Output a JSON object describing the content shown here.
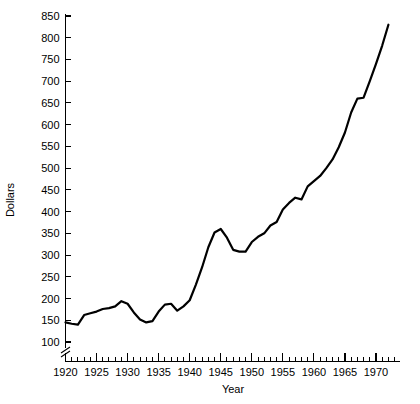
{
  "chart_data": {
    "type": "line",
    "title": "",
    "subtitle": "",
    "xlabel": "Year",
    "ylabel": "Dollars",
    "grid": false,
    "legend": "none",
    "xlim": [
      1920,
      1973
    ],
    "ylim": [
      90,
      850
    ],
    "y_axis_break": true,
    "y_axis_break_note": "axis broken below 100",
    "x_ticks_major": [
      1920,
      1925,
      1930,
      1935,
      1940,
      1945,
      1950,
      1955,
      1960,
      1965,
      1970
    ],
    "x_tick_labels": [
      "1920",
      "1925",
      "1930",
      "1935",
      "1940",
      "1945",
      "1950",
      "1955",
      "1960",
      "1965",
      "1970"
    ],
    "x_minor_tick_step": 1,
    "y_ticks": [
      100,
      150,
      200,
      250,
      300,
      350,
      400,
      450,
      500,
      550,
      600,
      650,
      700,
      750,
      800,
      850
    ],
    "y_tick_labels": [
      "100",
      "150",
      "200",
      "250",
      "300",
      "350",
      "400",
      "450",
      "500",
      "550",
      "600",
      "650",
      "700",
      "750",
      "800",
      "850"
    ],
    "series": [
      {
        "name": "Dollars",
        "color": "#000000",
        "x": [
          1920,
          1921,
          1922,
          1923,
          1924,
          1925,
          1926,
          1927,
          1928,
          1929,
          1930,
          1931,
          1932,
          1933,
          1934,
          1935,
          1936,
          1937,
          1938,
          1939,
          1940,
          1941,
          1942,
          1943,
          1944,
          1945,
          1946,
          1947,
          1948,
          1949,
          1950,
          1951,
          1952,
          1953,
          1954,
          1955,
          1956,
          1957,
          1958,
          1959,
          1960,
          1961,
          1962,
          1963,
          1964,
          1965,
          1966,
          1967,
          1968,
          1969,
          1970,
          1971,
          1972
        ],
        "values": [
          145,
          142,
          140,
          162,
          166,
          170,
          176,
          178,
          182,
          194,
          188,
          168,
          152,
          145,
          148,
          170,
          186,
          188,
          172,
          182,
          196,
          232,
          272,
          318,
          352,
          360,
          340,
          312,
          308,
          308,
          330,
          342,
          350,
          368,
          376,
          405,
          420,
          432,
          428,
          458,
          470,
          482,
          500,
          520,
          548,
          582,
          628,
          660,
          662,
          700,
          740,
          782,
          830
        ]
      }
    ],
    "annotations": []
  },
  "axis": {
    "y_title": "Dollars",
    "x_title": "Year"
  }
}
